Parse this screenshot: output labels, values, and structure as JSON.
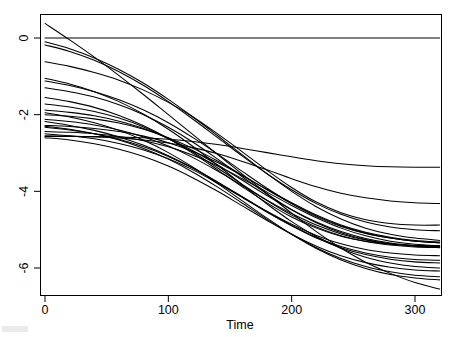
{
  "figure": {
    "name": "spaghetti-plot",
    "background": "#ffffff",
    "line_color": "#000000"
  },
  "chart_data": {
    "type": "line",
    "title": "",
    "subtitle": "",
    "xlabel": "Time",
    "ylabel": "",
    "xlim": [
      -10,
      330
    ],
    "ylim": [
      -6.9,
      0.45
    ],
    "xticks": [
      0,
      100,
      200,
      300
    ],
    "xtick_labels": [
      "0",
      "100",
      "200",
      "300"
    ],
    "yticks": [
      0,
      -2,
      -4,
      -6
    ],
    "ytick_labels": [
      "0",
      "-2",
      "-4",
      "-6"
    ],
    "grid": false,
    "legend": null,
    "legend_position": "none",
    "annotations": [],
    "x": [
      0,
      20,
      40,
      60,
      80,
      100,
      120,
      140,
      160,
      180,
      200,
      220,
      240,
      260,
      280,
      300,
      320
    ],
    "series": [
      {
        "name": "curve-01",
        "values": [
          0.0,
          0.0,
          0.0,
          0.0,
          0.0,
          0.0,
          0.0,
          0.0,
          0.0,
          0.0,
          0.0,
          0.0,
          0.0,
          0.0,
          0.0,
          0.0,
          0.0
        ]
      },
      {
        "name": "curve-02",
        "values": [
          0.38,
          -0.05,
          -0.5,
          -0.98,
          -1.48,
          -2.0,
          -2.52,
          -3.04,
          -3.55,
          -4.06,
          -4.57,
          -5.05,
          -5.48,
          -5.85,
          -6.14,
          -6.38,
          -6.55
        ]
      },
      {
        "name": "curve-03",
        "values": [
          -0.1,
          -0.28,
          -0.52,
          -0.82,
          -1.18,
          -1.6,
          -2.06,
          -2.55,
          -3.05,
          -3.54,
          -4.0,
          -4.4,
          -4.72,
          -4.96,
          -5.12,
          -5.22,
          -5.28
        ]
      },
      {
        "name": "curve-04",
        "values": [
          -0.18,
          -0.35,
          -0.58,
          -0.88,
          -1.24,
          -1.66,
          -2.12,
          -2.6,
          -3.08,
          -3.54,
          -3.96,
          -4.32,
          -4.6,
          -4.8,
          -4.93,
          -5.0,
          -5.03
        ]
      },
      {
        "name": "curve-05",
        "values": [
          -0.62,
          -0.74,
          -0.9,
          -1.1,
          -1.36,
          -1.68,
          -2.06,
          -2.5,
          -2.97,
          -3.45,
          -3.9,
          -4.28,
          -4.56,
          -4.74,
          -4.84,
          -4.88,
          -4.88
        ]
      },
      {
        "name": "curve-06",
        "values": [
          -1.12,
          -1.24,
          -1.4,
          -1.61,
          -1.88,
          -2.21,
          -2.6,
          -3.03,
          -3.48,
          -3.92,
          -4.32,
          -4.66,
          -4.92,
          -5.1,
          -5.22,
          -5.3,
          -5.34
        ]
      },
      {
        "name": "curve-07",
        "values": [
          -1.3,
          -1.4,
          -1.54,
          -1.74,
          -2.0,
          -2.33,
          -2.72,
          -3.16,
          -3.62,
          -4.07,
          -4.48,
          -4.82,
          -5.08,
          -5.26,
          -5.37,
          -5.43,
          -5.45
        ]
      },
      {
        "name": "curve-08",
        "values": [
          -1.55,
          -1.66,
          -1.81,
          -2.02,
          -2.29,
          -2.62,
          -3.01,
          -3.44,
          -3.88,
          -4.3,
          -4.67,
          -4.96,
          -5.17,
          -5.3,
          -5.38,
          -5.41,
          -5.42
        ]
      },
      {
        "name": "curve-09",
        "values": [
          -1.72,
          -1.8,
          -1.92,
          -2.09,
          -2.32,
          -2.62,
          -2.98,
          -3.39,
          -3.82,
          -4.24,
          -4.62,
          -4.93,
          -5.16,
          -5.31,
          -5.4,
          -5.45,
          -5.47
        ]
      },
      {
        "name": "curve-10",
        "values": [
          -1.88,
          -1.94,
          -2.03,
          -2.17,
          -2.36,
          -2.62,
          -2.94,
          -3.31,
          -3.71,
          -4.11,
          -4.48,
          -4.8,
          -5.05,
          -5.23,
          -5.35,
          -5.42,
          -5.46
        ]
      },
      {
        "name": "curve-11",
        "values": [
          -2.0,
          -2.04,
          -2.11,
          -2.22,
          -2.38,
          -2.6,
          -2.88,
          -3.21,
          -3.58,
          -3.96,
          -4.32,
          -4.64,
          -4.9,
          -5.09,
          -5.22,
          -5.3,
          -5.34
        ]
      },
      {
        "name": "curve-12",
        "values": [
          -2.12,
          -2.18,
          -2.27,
          -2.4,
          -2.58,
          -2.82,
          -3.12,
          -3.47,
          -3.85,
          -4.23,
          -4.58,
          -4.88,
          -5.11,
          -5.27,
          -5.37,
          -5.42,
          -5.44
        ]
      },
      {
        "name": "curve-13",
        "values": [
          -2.28,
          -2.31,
          -2.36,
          -2.44,
          -2.56,
          -2.73,
          -2.96,
          -3.25,
          -3.59,
          -3.95,
          -4.3,
          -4.62,
          -4.88,
          -5.07,
          -5.2,
          -5.28,
          -5.32
        ]
      },
      {
        "name": "curve-14",
        "values": [
          -2.33,
          -2.4,
          -2.5,
          -2.64,
          -2.84,
          -3.09,
          -3.4,
          -3.76,
          -4.14,
          -4.52,
          -4.86,
          -5.15,
          -5.37,
          -5.52,
          -5.61,
          -5.66,
          -5.68
        ]
      },
      {
        "name": "curve-15",
        "values": [
          -2.44,
          -2.46,
          -2.5,
          -2.57,
          -2.68,
          -2.84,
          -3.06,
          -3.34,
          -3.67,
          -4.02,
          -4.37,
          -4.69,
          -4.96,
          -5.16,
          -5.3,
          -5.38,
          -5.42
        ]
      },
      {
        "name": "curve-16",
        "values": [
          -2.5,
          -2.55,
          -2.63,
          -2.75,
          -2.92,
          -3.15,
          -3.44,
          -3.79,
          -4.16,
          -4.54,
          -4.89,
          -5.2,
          -5.44,
          -5.61,
          -5.72,
          -5.78,
          -5.8
        ]
      },
      {
        "name": "curve-17",
        "values": [
          -2.55,
          -2.56,
          -2.58,
          -2.61,
          -2.66,
          -2.74,
          -2.86,
          -3.02,
          -3.22,
          -3.44,
          -3.67,
          -3.88,
          -4.05,
          -4.17,
          -4.25,
          -4.3,
          -4.32
        ]
      },
      {
        "name": "curve-18",
        "values": [
          -2.57,
          -2.57,
          -2.57,
          -2.58,
          -2.6,
          -2.64,
          -2.7,
          -2.78,
          -2.88,
          -2.99,
          -3.1,
          -3.2,
          -3.28,
          -3.33,
          -3.36,
          -3.37,
          -3.37
        ]
      },
      {
        "name": "curve-19",
        "values": [
          -2.18,
          -2.28,
          -2.41,
          -2.58,
          -2.8,
          -3.07,
          -3.39,
          -3.76,
          -4.15,
          -4.54,
          -4.9,
          -5.22,
          -5.47,
          -5.65,
          -5.77,
          -5.84,
          -5.87
        ]
      },
      {
        "name": "curve-20",
        "values": [
          -2.3,
          -2.38,
          -2.5,
          -2.66,
          -2.88,
          -3.16,
          -3.5,
          -3.89,
          -4.31,
          -4.73,
          -5.12,
          -5.47,
          -5.75,
          -5.96,
          -6.1,
          -6.19,
          -6.23
        ]
      },
      {
        "name": "curve-21",
        "values": [
          -1.95,
          -2.06,
          -2.21,
          -2.41,
          -2.67,
          -2.99,
          -3.37,
          -3.8,
          -4.25,
          -4.7,
          -5.12,
          -5.49,
          -5.79,
          -6.01,
          -6.17,
          -6.26,
          -6.31
        ]
      },
      {
        "name": "curve-22",
        "values": [
          -2.6,
          -2.66,
          -2.76,
          -2.9,
          -3.09,
          -3.34,
          -3.65,
          -4.0,
          -4.38,
          -4.76,
          -5.12,
          -5.43,
          -5.68,
          -5.86,
          -5.98,
          -6.05,
          -6.08
        ]
      },
      {
        "name": "curve-23",
        "values": [
          -1.05,
          -1.2,
          -1.4,
          -1.66,
          -1.99,
          -2.38,
          -2.83,
          -3.32,
          -3.83,
          -4.33,
          -4.79,
          -5.18,
          -5.49,
          -5.72,
          -5.87,
          -5.96,
          -6.0
        ]
      }
    ]
  },
  "axes": {
    "x_title": "Time",
    "x_tick_labels": [
      "0",
      "100",
      "200",
      "300"
    ],
    "y_tick_labels": [
      "0",
      "-2",
      "-4",
      "-6"
    ]
  }
}
